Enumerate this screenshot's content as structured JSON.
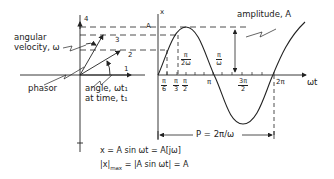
{
  "diagram": {
    "phasor_panel": {
      "labels": {
        "angular_velocity_line1": "angular",
        "angular_velocity_line2": "velocity, ω",
        "phasor": "phasor",
        "angle_line1": "angle, ωt₁",
        "angle_line2": "at time, t₁"
      },
      "positions": [
        "1",
        "2",
        "3",
        "4"
      ],
      "amplitude_marker": "A"
    },
    "sine_panel": {
      "y_axis_label": "x",
      "x_axis_label": "ωt",
      "amplitude_label": "amplitude, A",
      "ticks": [
        {
          "num": "π",
          "den": "6"
        },
        {
          "num": "π",
          "den": "3"
        },
        {
          "num": "π",
          "den": "2"
        },
        {
          "single": "π"
        },
        {
          "num": "3π",
          "den": "2"
        },
        {
          "single": "2π"
        }
      ],
      "annotations": {
        "pi_over_2w": {
          "num": "π",
          "den": "2ω"
        },
        "pi_over_w": {
          "num": "π",
          "den": "ω"
        }
      },
      "period_label": "P = 2π/ω"
    },
    "equations": {
      "line1": "x = A sin ωt = A[jω]",
      "line2_left": "|x|",
      "line2_sub": "max",
      "line2_right": " = |A sin ωt| = A"
    }
  }
}
